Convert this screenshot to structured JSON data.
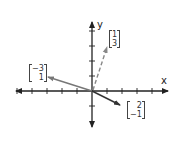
{
  "diagram": {
    "type": "vector-plot",
    "origin_px": [
      92,
      91
    ],
    "unit_px": 15,
    "axes": {
      "x_label": "x",
      "y_label": "y",
      "x_ticks": [
        -5,
        -4,
        -3,
        -2,
        -1,
        1,
        2,
        3,
        4,
        5
      ],
      "y_ticks": [
        -2,
        -1,
        1,
        2,
        3,
        4
      ]
    },
    "vectors": [
      {
        "id": "v1",
        "components": [
          1,
          3
        ],
        "label_top": "1",
        "label_bottom": "3",
        "style": "dashed",
        "color": "#888888"
      },
      {
        "id": "v2",
        "components": [
          -3,
          1
        ],
        "label_top": "−3",
        "label_bottom": "1",
        "style": "solid",
        "color": "#777777"
      },
      {
        "id": "v3",
        "components": [
          2,
          -1
        ],
        "label_top": "2",
        "label_bottom": "−1",
        "style": "solid",
        "color": "#333333"
      }
    ]
  }
}
